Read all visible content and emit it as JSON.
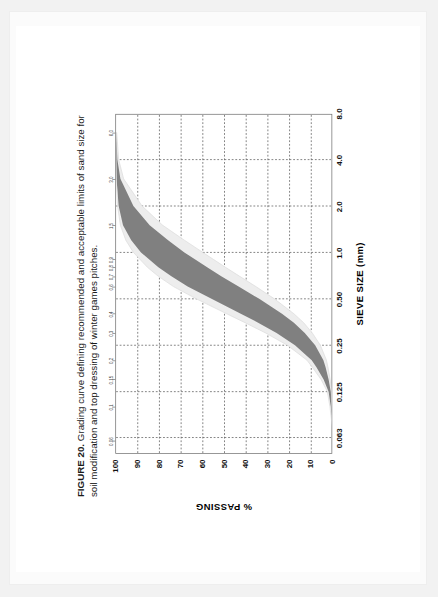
{
  "figure": {
    "number_label": "FIGURE 20.",
    "caption_text": "Grading curve defining recommended and acceptable limits of sand size for soil modification and top dressing of winter games pitches."
  },
  "chart_data": {
    "type": "area",
    "title": "Grading curve defining recommended and acceptable limits of sand size for soil modification and top dressing of winter games pitches.",
    "xlabel": "SIEVE SIZE (mm)",
    "ylabel": "% PASSING",
    "xscale": "log",
    "xlim": [
      0.05,
      8.0
    ],
    "ylim": [
      0,
      100
    ],
    "grid": true,
    "legend": "none",
    "x_major_ticks": [
      "0.063",
      "0.125",
      "0.25",
      "0.50",
      "1.0",
      "2.0",
      "4.0",
      "8.0"
    ],
    "x_major_values": [
      0.063,
      0.125,
      0.25,
      0.5,
      1.0,
      2.0,
      4.0,
      8.0
    ],
    "x_minor_ticks": [
      "0.06",
      "0.1",
      "0.15",
      "0.2",
      "0.3",
      "0.4",
      "0.6",
      "0.7",
      "0.8",
      "0.9",
      "1.5",
      "3.0",
      "6.0"
    ],
    "x_minor_values": [
      0.06,
      0.1,
      0.15,
      0.2,
      0.3,
      0.4,
      0.6,
      0.7,
      0.8,
      0.9,
      1.5,
      3.0,
      6.0
    ],
    "y_ticks": [
      "0",
      "10",
      "20",
      "30",
      "40",
      "50",
      "60",
      "70",
      "80",
      "90",
      "100"
    ],
    "y_values": [
      0,
      10,
      20,
      30,
      40,
      50,
      60,
      70,
      80,
      90,
      100
    ],
    "colors": {
      "recommended_band": "#808080",
      "acceptable_band": "#ededed",
      "axis": "#6f6f6f",
      "grid": "#555555",
      "text": "#111111"
    },
    "series": [
      {
        "name": "Acceptable limit - coarse side (upper x)",
        "role": "acceptable_outer_upper",
        "x": [
          0.063,
          0.08,
          0.1,
          0.125,
          0.15,
          0.18,
          0.2,
          0.25,
          0.3,
          0.35,
          0.4,
          0.5,
          0.6,
          0.7,
          0.8,
          1.0,
          1.2,
          1.5,
          2.0,
          3.0,
          4.0,
          6.0
        ],
        "y": [
          0.0,
          0.6,
          1.4,
          2.6,
          5.5,
          9.5,
          12.0,
          21.0,
          31.0,
          40.5,
          49.0,
          63.0,
          73.5,
          80.5,
          85.5,
          92.0,
          95.5,
          98.0,
          99.3,
          99.9,
          100.0,
          100.0
        ]
      },
      {
        "name": "Recommended limit - coarse side",
        "role": "recommended_upper",
        "x": [
          0.063,
          0.08,
          0.1,
          0.125,
          0.15,
          0.18,
          0.2,
          0.25,
          0.3,
          0.35,
          0.4,
          0.5,
          0.6,
          0.7,
          0.8,
          1.0,
          1.2,
          1.5,
          2.0,
          3.0,
          4.0,
          6.0
        ],
        "y": [
          0.0,
          0.4,
          1.0,
          2.0,
          4.3,
          7.6,
          9.8,
          17.5,
          26.0,
          34.5,
          42.5,
          56.0,
          67.0,
          74.5,
          80.5,
          88.5,
          93.0,
          96.8,
          98.8,
          99.8,
          100.0,
          100.0
        ]
      },
      {
        "name": "Recommended limit - fine side",
        "role": "recommended_lower",
        "x": [
          0.063,
          0.08,
          0.1,
          0.125,
          0.15,
          0.18,
          0.2,
          0.25,
          0.3,
          0.35,
          0.4,
          0.5,
          0.6,
          0.7,
          0.8,
          1.0,
          1.2,
          1.5,
          2.0,
          3.0,
          4.0,
          6.0
        ],
        "y": [
          0.0,
          0.2,
          0.5,
          1.0,
          2.0,
          3.4,
          4.4,
          8.2,
          13.0,
          18.0,
          23.5,
          34.0,
          43.5,
          51.5,
          58.0,
          68.5,
          76.0,
          84.5,
          92.0,
          98.0,
          99.4,
          99.9
        ]
      },
      {
        "name": "Acceptable limit - fine side (lower x)",
        "role": "acceptable_outer_lower",
        "x": [
          0.063,
          0.08,
          0.1,
          0.125,
          0.15,
          0.18,
          0.2,
          0.25,
          0.3,
          0.35,
          0.4,
          0.5,
          0.6,
          0.7,
          0.8,
          1.0,
          1.2,
          1.5,
          2.0,
          3.0,
          4.0,
          6.0
        ],
        "y": [
          0.0,
          0.1,
          0.3,
          0.6,
          1.3,
          2.3,
          3.0,
          5.8,
          9.5,
          13.5,
          18.0,
          27.0,
          35.5,
          43.0,
          49.5,
          60.0,
          68.5,
          78.5,
          88.0,
          96.5,
          98.8,
          99.7
        ]
      }
    ]
  }
}
